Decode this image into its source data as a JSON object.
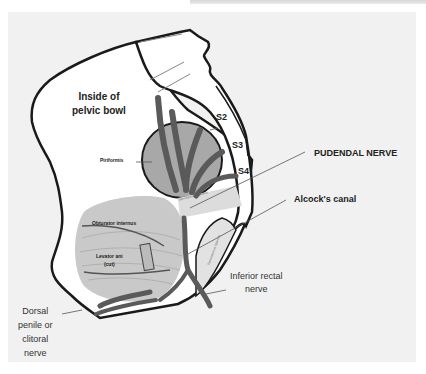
{
  "diagram": {
    "title_region": "Pudendal nerve anatomy",
    "labels": {
      "inside_pelvic_bowl_line1": "Inside of",
      "inside_pelvic_bowl_line2": "pelvic bowl",
      "s2": "S2",
      "s3": "S3",
      "s4": "S4",
      "piriformis": "Piriformis",
      "pudendal_nerve": "PUDENDAL NERVE",
      "sacrospinous_ligament": "Sacrospinous ligament",
      "alcocks_canal": "Alcock's canal",
      "obturator_internus": "Obturator internus",
      "levator_ani_line1": "Levator ani",
      "levator_ani_line2": "(cut)",
      "sacrotuberous_ligament": "Sacrotuberous ligament",
      "inferior_rectal_line1": "Inferior rectal",
      "inferior_rectal_line2": "nerve",
      "dorsal_line1": "Dorsal",
      "dorsal_line2": "penile or",
      "dorsal_line3": "clitoral",
      "dorsal_line4": "nerve"
    },
    "colors": {
      "background": "#f1f1f1",
      "bone_fill": "#ffffff",
      "outline": "#1a1a1a",
      "nerve": "#5a5a5a",
      "muscle": "#c9c9c9",
      "piriformis": "#a8a8a8",
      "ligament": "#dcdcdc"
    }
  }
}
